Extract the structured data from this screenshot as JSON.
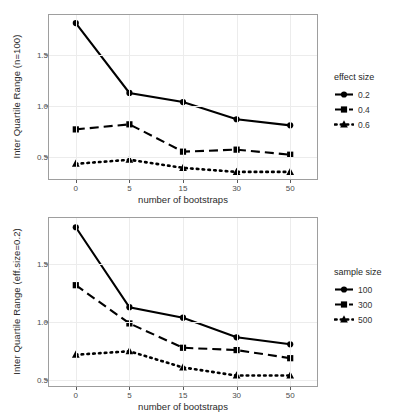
{
  "figure": {
    "background_color": "#ffffff",
    "line_color": "#000000",
    "panel_border_color": "#9e9e9e",
    "grid_color": "#ececec"
  },
  "chart_data": [
    {
      "id": "top",
      "type": "line",
      "title": "",
      "xlabel": "number of bootstraps",
      "ylabel": "Inter Quartile Range (n=100)",
      "categories": [
        "0",
        "5",
        "15",
        "30",
        "50"
      ],
      "yticks": [
        "0.5",
        "1.0",
        "1.5"
      ],
      "ytick_values": [
        0.5,
        1.0,
        1.5
      ],
      "ylim": [
        0.28,
        1.9
      ],
      "grid": true,
      "legend_position": "right",
      "legend_title": "effect size",
      "series": [
        {
          "name": "0.2",
          "marker": "circle",
          "linestyle": "solid",
          "values": [
            1.82,
            1.13,
            1.04,
            0.87,
            0.81
          ]
        },
        {
          "name": "0.4",
          "marker": "square",
          "linestyle": "dashed",
          "values": [
            0.77,
            0.82,
            0.55,
            0.57,
            0.52
          ]
        },
        {
          "name": "0.6",
          "marker": "triangle",
          "linestyle": "dotted",
          "values": [
            0.43,
            0.47,
            0.39,
            0.35,
            0.35
          ]
        }
      ]
    },
    {
      "id": "bottom",
      "type": "line",
      "title": "",
      "xlabel": "number of bootstraps",
      "ylabel": "Inter Quartile Range (eff.size=0.2)",
      "categories": [
        "0",
        "5",
        "15",
        "30",
        "50"
      ],
      "yticks": [
        "0.5",
        "1.0",
        "1.5"
      ],
      "ytick_values": [
        0.5,
        1.0,
        1.5
      ],
      "ylim": [
        0.45,
        1.9
      ],
      "grid": true,
      "legend_position": "right",
      "legend_title": "sample size",
      "series": [
        {
          "name": "100",
          "marker": "circle",
          "linestyle": "solid",
          "values": [
            1.82,
            1.13,
            1.04,
            0.87,
            0.81
          ]
        },
        {
          "name": "300",
          "marker": "square",
          "linestyle": "dashed",
          "values": [
            1.32,
            0.99,
            0.78,
            0.76,
            0.69
          ]
        },
        {
          "name": "500",
          "marker": "triangle",
          "linestyle": "dotted",
          "values": [
            0.72,
            0.75,
            0.61,
            0.54,
            0.54
          ]
        }
      ]
    }
  ]
}
